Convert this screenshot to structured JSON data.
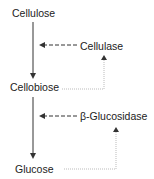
{
  "diagram": {
    "nodes": {
      "substrate": "Cellulose",
      "intermediate": "Cellobiose",
      "product": "Glucose"
    },
    "enzymes": {
      "first": "Cellulase",
      "second": "β-Glucosidase"
    },
    "edges": [
      {
        "from": "Cellulose",
        "to": "Cellobiose",
        "style": "solid"
      },
      {
        "from": "Cellobiose",
        "to": "Glucose",
        "style": "solid"
      },
      {
        "from": "Cellulase",
        "to": "Cellulose→Cellobiose",
        "style": "dashed",
        "meaning": "catalyzes"
      },
      {
        "from": "Cellobiose",
        "to": "Cellulase",
        "style": "dotted",
        "meaning": "feedback"
      },
      {
        "from": "β-Glucosidase",
        "to": "Cellobiose→Glucose",
        "style": "dashed",
        "meaning": "catalyzes"
      },
      {
        "from": "Glucose",
        "to": "β-Glucosidase",
        "style": "dotted",
        "meaning": "feedback"
      }
    ],
    "colors": {
      "text": "#222222",
      "arrow": "#333333",
      "dotted": "#aaaaaa"
    }
  }
}
